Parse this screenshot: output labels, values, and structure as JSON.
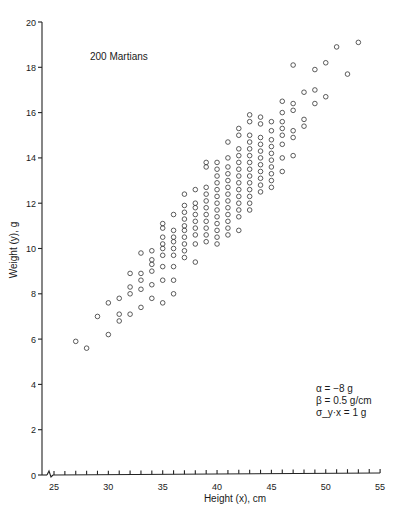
{
  "chart_data": {
    "type": "scatter",
    "title": "200 Martians",
    "xlabel": "Height (x), cm",
    "ylabel": "Weight (y), g",
    "xlim": [
      24,
      55
    ],
    "ylim": [
      0,
      20
    ],
    "x_ticks": [
      25,
      30,
      35,
      40,
      45,
      50,
      55
    ],
    "y_ticks": [
      0,
      2,
      4,
      6,
      8,
      10,
      12,
      14,
      16,
      18,
      20
    ],
    "x_minor_step": 1,
    "axis_break": true,
    "grid": false,
    "legend": null,
    "marker": "open-circle",
    "annotations": [
      {
        "text": "α = −8 g",
        "position": "lower-right"
      },
      {
        "text": "β = 0.5 g/cm",
        "position": "lower-right"
      },
      {
        "text": "σ_y·x = 1 g",
        "position": "lower-right"
      }
    ],
    "model": {
      "alpha": -8,
      "beta": 0.5,
      "sigma": 1
    },
    "n": 200,
    "points": [
      [
        27,
        5.9
      ],
      [
        28,
        5.6
      ],
      [
        29,
        7.0
      ],
      [
        30,
        6.2
      ],
      [
        30,
        7.6
      ],
      [
        31,
        6.8
      ],
      [
        31,
        7.1
      ],
      [
        31,
        7.8
      ],
      [
        32,
        7.1
      ],
      [
        32,
        8.0
      ],
      [
        32,
        8.3
      ],
      [
        32,
        8.9
      ],
      [
        33,
        7.4
      ],
      [
        33,
        8.2
      ],
      [
        33,
        8.6
      ],
      [
        33,
        8.9
      ],
      [
        33,
        9.8
      ],
      [
        34,
        7.8
      ],
      [
        34,
        8.4
      ],
      [
        34,
        9.0
      ],
      [
        34,
        9.3
      ],
      [
        34,
        9.5
      ],
      [
        34,
        9.9
      ],
      [
        35,
        7.6
      ],
      [
        35,
        8.6
      ],
      [
        35,
        9.2
      ],
      [
        35,
        9.7
      ],
      [
        35,
        10.0
      ],
      [
        35,
        10.2
      ],
      [
        35,
        10.5
      ],
      [
        35,
        10.9
      ],
      [
        35,
        11.1
      ],
      [
        36,
        8.0
      ],
      [
        36,
        8.6
      ],
      [
        36,
        9.2
      ],
      [
        36,
        9.7
      ],
      [
        36,
        10.0
      ],
      [
        36,
        10.3
      ],
      [
        36,
        10.5
      ],
      [
        36,
        10.8
      ],
      [
        36,
        11.5
      ],
      [
        37,
        9.6
      ],
      [
        37,
        9.9
      ],
      [
        37,
        10.2
      ],
      [
        37,
        10.5
      ],
      [
        37,
        10.8
      ],
      [
        37,
        11.0
      ],
      [
        37,
        11.3
      ],
      [
        37,
        11.6
      ],
      [
        37,
        11.9
      ],
      [
        37,
        12.4
      ],
      [
        38,
        9.4
      ],
      [
        38,
        10.2
      ],
      [
        38,
        10.6
      ],
      [
        38,
        10.9
      ],
      [
        38,
        11.2
      ],
      [
        38,
        11.5
      ],
      [
        38,
        11.8
      ],
      [
        38,
        12.0
      ],
      [
        38,
        12.6
      ],
      [
        39,
        10.3
      ],
      [
        39,
        10.6
      ],
      [
        39,
        10.9
      ],
      [
        39,
        11.2
      ],
      [
        39,
        11.5
      ],
      [
        39,
        11.8
      ],
      [
        39,
        12.1
      ],
      [
        39,
        12.4
      ],
      [
        39,
        12.7
      ],
      [
        39,
        13.6
      ],
      [
        39,
        13.8
      ],
      [
        40,
        10.2
      ],
      [
        40,
        10.5
      ],
      [
        40,
        10.8
      ],
      [
        40,
        11.1
      ],
      [
        40,
        11.4
      ],
      [
        40,
        11.7
      ],
      [
        40,
        12.0
      ],
      [
        40,
        12.3
      ],
      [
        40,
        12.6
      ],
      [
        40,
        12.9
      ],
      [
        40,
        13.2
      ],
      [
        40,
        13.5
      ],
      [
        40,
        13.8
      ],
      [
        41,
        10.6
      ],
      [
        41,
        10.9
      ],
      [
        41,
        11.2
      ],
      [
        41,
        11.5
      ],
      [
        41,
        11.8
      ],
      [
        41,
        12.1
      ],
      [
        41,
        12.4
      ],
      [
        41,
        12.7
      ],
      [
        41,
        13.0
      ],
      [
        41,
        13.3
      ],
      [
        41,
        13.6
      ],
      [
        41,
        14.0
      ],
      [
        41,
        14.7
      ],
      [
        42,
        10.8
      ],
      [
        42,
        11.4
      ],
      [
        42,
        11.7
      ],
      [
        42,
        12.0
      ],
      [
        42,
        12.3
      ],
      [
        42,
        12.6
      ],
      [
        42,
        12.9
      ],
      [
        42,
        13.2
      ],
      [
        42,
        13.5
      ],
      [
        42,
        13.8
      ],
      [
        42,
        14.1
      ],
      [
        42,
        14.4
      ],
      [
        42,
        15.0
      ],
      [
        42,
        15.3
      ],
      [
        43,
        11.7
      ],
      [
        43,
        12.0
      ],
      [
        43,
        12.3
      ],
      [
        43,
        12.6
      ],
      [
        43,
        12.9
      ],
      [
        43,
        13.2
      ],
      [
        43,
        13.5
      ],
      [
        43,
        13.8
      ],
      [
        43,
        14.1
      ],
      [
        43,
        14.4
      ],
      [
        43,
        14.7
      ],
      [
        43,
        15.0
      ],
      [
        43,
        15.6
      ],
      [
        43,
        15.9
      ],
      [
        44,
        12.5
      ],
      [
        44,
        12.8
      ],
      [
        44,
        13.1
      ],
      [
        44,
        13.4
      ],
      [
        44,
        13.7
      ],
      [
        44,
        14.0
      ],
      [
        44,
        14.3
      ],
      [
        44,
        14.6
      ],
      [
        44,
        14.9
      ],
      [
        44,
        15.5
      ],
      [
        44,
        15.8
      ],
      [
        45,
        12.7
      ],
      [
        45,
        13.0
      ],
      [
        45,
        13.3
      ],
      [
        45,
        13.6
      ],
      [
        45,
        13.9
      ],
      [
        45,
        14.2
      ],
      [
        45,
        14.5
      ],
      [
        45,
        14.8
      ],
      [
        45,
        15.2
      ],
      [
        45,
        15.6
      ],
      [
        46,
        13.4
      ],
      [
        46,
        14.0
      ],
      [
        46,
        14.6
      ],
      [
        46,
        15.0
      ],
      [
        46,
        15.3
      ],
      [
        46,
        15.6
      ],
      [
        46,
        16.0
      ],
      [
        46,
        16.5
      ],
      [
        47,
        14.1
      ],
      [
        47,
        14.9
      ],
      [
        47,
        15.2
      ],
      [
        47,
        16.1
      ],
      [
        47,
        16.4
      ],
      [
        47,
        18.1
      ],
      [
        48,
        15.4
      ],
      [
        48,
        15.7
      ],
      [
        48,
        16.9
      ],
      [
        49,
        16.4
      ],
      [
        49,
        17.0
      ],
      [
        49,
        17.9
      ],
      [
        50,
        16.7
      ],
      [
        50,
        18.2
      ],
      [
        51,
        18.9
      ],
      [
        52,
        17.7
      ],
      [
        53,
        19.1
      ]
    ]
  }
}
